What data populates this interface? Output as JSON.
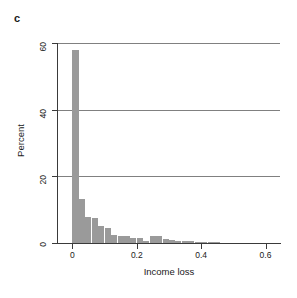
{
  "panel": {
    "label": "c"
  },
  "chart_data": {
    "type": "bar",
    "title": "",
    "subtitle": "",
    "xlabel": "Income loss",
    "ylabel": "Percent",
    "xlim": [
      -0.045,
      0.645
    ],
    "ylim": [
      0,
      60
    ],
    "grid": "horizontal",
    "legend": "none",
    "bar_color": "#9a9a9a",
    "bin_width": 0.02,
    "x_ticks": [
      "0",
      "0.2",
      "0.4",
      "0.6"
    ],
    "x_tick_values": [
      0,
      0.2,
      0.4,
      0.6
    ],
    "y_ticks": [
      "0",
      "20",
      "40",
      "60"
    ],
    "y_tick_values": [
      0,
      20,
      40,
      60
    ],
    "gridline_values": [
      20,
      40,
      60
    ],
    "x": [
      0.0,
      0.02,
      0.04,
      0.06,
      0.08,
      0.1,
      0.12,
      0.14,
      0.16,
      0.18,
      0.2,
      0.22,
      0.24,
      0.26,
      0.28,
      0.3,
      0.32,
      0.34,
      0.36,
      0.38,
      0.4,
      0.42,
      0.44
    ],
    "categories": [
      "0.00-0.02",
      "0.02-0.04",
      "0.04-0.06",
      "0.06-0.08",
      "0.08-0.10",
      "0.10-0.12",
      "0.12-0.14",
      "0.14-0.16",
      "0.16-0.18",
      "0.18-0.20",
      "0.20-0.22",
      "0.22-0.24",
      "0.24-0.26",
      "0.26-0.28",
      "0.28-0.30",
      "0.30-0.32",
      "0.32-0.34",
      "0.34-0.36",
      "0.36-0.38",
      "0.38-0.40",
      "0.40-0.42",
      "0.42-0.44",
      "0.44-0.46"
    ],
    "values": [
      58.0,
      13.2,
      7.8,
      7.6,
      5.0,
      4.6,
      2.4,
      2.2,
      2.1,
      1.5,
      1.4,
      0.7,
      2.1,
      2.2,
      1.1,
      1.0,
      0.5,
      0.6,
      0.5,
      0.15,
      0.1,
      0.1,
      0.2
    ]
  }
}
